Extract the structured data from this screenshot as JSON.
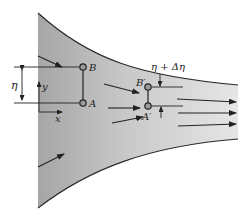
{
  "diagram": {
    "type": "converging-channel-flow",
    "colors": {
      "fluid_dark": "#a9a9a9",
      "fluid_light": "#e4e4e4",
      "boundary": "#2a2a2a",
      "arrow": "#222222",
      "point_fill": "#9a9a9a"
    },
    "labels": {
      "point_a": "A",
      "point_b": "B",
      "point_a_prime": "A′",
      "point_b_prime": "B′",
      "eta": "η",
      "eta_plus_delta": "η + Δη",
      "axis_x": "x",
      "axis_y": "y"
    },
    "points": [
      {
        "id": "B",
        "x": 83,
        "y": 67
      },
      {
        "id": "A",
        "x": 83,
        "y": 103
      },
      {
        "id": "B'",
        "x": 148,
        "y": 87
      },
      {
        "id": "A'",
        "x": 148,
        "y": 106
      }
    ],
    "flow_arrows": [
      {
        "x1": 38,
        "y1": 56,
        "x2": 62,
        "y2": 68
      },
      {
        "x1": 104,
        "y1": 84,
        "x2": 138,
        "y2": 93
      },
      {
        "x1": 108,
        "y1": 108,
        "x2": 138,
        "y2": 108
      },
      {
        "x1": 42,
        "y1": 76,
        "x2": 60,
        "y2": 76
      },
      {
        "x1": 177,
        "y1": 99,
        "x2": 235,
        "y2": 103
      },
      {
        "x1": 177,
        "y1": 114,
        "x2": 235,
        "y2": 114
      },
      {
        "x1": 112,
        "y1": 122,
        "x2": 142,
        "y2": 117
      },
      {
        "x1": 176,
        "y1": 126,
        "x2": 234,
        "y2": 124
      },
      {
        "x1": 38,
        "y1": 167,
        "x2": 63,
        "y2": 154
      }
    ]
  }
}
